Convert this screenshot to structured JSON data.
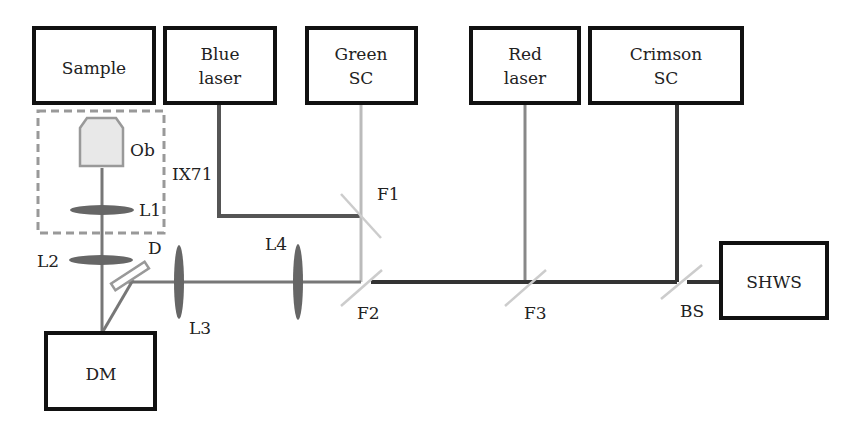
{
  "diagram": {
    "boxes": {
      "sample": [
        "Sample"
      ],
      "blue_laser": [
        "Blue",
        "laser"
      ],
      "green_sc": [
        "Green",
        "SC"
      ],
      "red_laser": [
        "Red",
        "laser"
      ],
      "crimson_sc": [
        "Crimson",
        "SC"
      ],
      "shws": [
        "SHWS"
      ],
      "dm": [
        "DM"
      ]
    },
    "labels": {
      "ob": "Ob",
      "ix71": "IX71",
      "l1": "L1",
      "l2": "L2",
      "l3": "L3",
      "l4": "L4",
      "d": "D",
      "f1": "F1",
      "f2": "F2",
      "f3": "F3",
      "bs": "BS"
    },
    "colors": {
      "box_stroke": "#111111",
      "blue_beam": "#555555",
      "green_beam": "#bbbbbb",
      "red_beam": "#888888",
      "crimson_beam": "#333333",
      "combined_beam": "#777777",
      "lens_fill": "#666666",
      "dashed_frame": "#999999",
      "objective_fill": "#e8e8e8",
      "filter_stroke": "#cccccc"
    }
  }
}
